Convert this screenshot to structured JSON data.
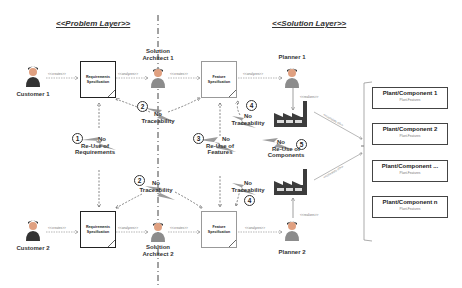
{
  "layers": {
    "problem": "<<Problem Layer>>",
    "solution": "<<Solution Layer>>"
  },
  "actors": {
    "customer1": "Customer 1",
    "customer2": "Customer 2",
    "architect1": [
      "Solution",
      "Architect 1"
    ],
    "architect2": [
      "Solution",
      "Architect 2"
    ],
    "planner1": "Planner 1",
    "planner2": "Planner 2"
  },
  "documents": {
    "req1": [
      "Requirements",
      "Specification"
    ],
    "req2": [
      "Requirements",
      "Specification"
    ],
    "feat1": [
      "Feature",
      "Specification"
    ],
    "feat2": [
      "Feature",
      "Specification"
    ]
  },
  "edge_labels": {
    "creates": "<<creates>>",
    "analyzes": "<<analyzes>>",
    "realizes": "<<realizes>>",
    "consists_of": "<<consists of>>"
  },
  "issues": [
    {
      "num": "1",
      "lines": [
        "No",
        "Re-Use of",
        "Requirements"
      ]
    },
    {
      "num": "2",
      "lines": [
        "No",
        "Traceability"
      ]
    },
    {
      "num": "2",
      "lines": [
        "No",
        "Traceability"
      ]
    },
    {
      "num": "3",
      "lines": [
        "No",
        "Re-Use of",
        "Features"
      ]
    },
    {
      "num": "4",
      "lines": [
        "No",
        "Traceability"
      ]
    },
    {
      "num": "4",
      "lines": [
        "No",
        "Traceability"
      ]
    },
    {
      "num": "5",
      "lines": [
        "No",
        "Re-Use of",
        "Components"
      ]
    }
  ],
  "components": [
    {
      "title": "Plant/Component 1",
      "sub": "Plant-Features"
    },
    {
      "title": "Plant/Component 2",
      "sub": "Plant-Features"
    },
    {
      "title": "Plant/Component ...",
      "sub": "Plant-Features"
    },
    {
      "title": "Plant/Component n",
      "sub": "Plant-Features"
    }
  ],
  "colors": {
    "lightning": "#8a8a8a",
    "factory": "#3c3c3c",
    "factory_window": "#dcdcdc",
    "person_skin": "#e0a080",
    "person_hair": "#333333",
    "person_shirt": "#8c8c8c"
  }
}
